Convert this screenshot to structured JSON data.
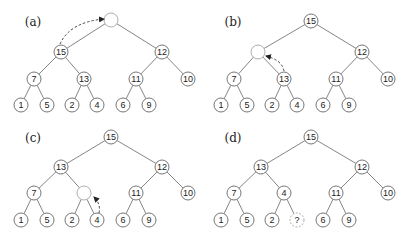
{
  "figure": {
    "panels": [
      {
        "id": "a",
        "label": "(a)",
        "offset": [
          0,
          0
        ],
        "nodes": [
          {
            "key": "root",
            "value": "",
            "style": "empty",
            "x": 111,
            "y": 20
          },
          {
            "key": "L",
            "value": "15",
            "style": "normal",
            "x": 61,
            "y": 52
          },
          {
            "key": "R",
            "value": "12",
            "style": "normal",
            "x": 162,
            "y": 52
          },
          {
            "key": "LL",
            "value": "7",
            "style": "normal",
            "x": 34,
            "y": 79
          },
          {
            "key": "LR",
            "value": "13",
            "style": "normal",
            "x": 84,
            "y": 79
          },
          {
            "key": "RL",
            "value": "11",
            "style": "normal",
            "x": 136,
            "y": 79
          },
          {
            "key": "RR",
            "value": "10",
            "style": "normal",
            "x": 188,
            "y": 79
          },
          {
            "key": "LLL",
            "value": "1",
            "style": "normal",
            "x": 21,
            "y": 105
          },
          {
            "key": "LLR",
            "value": "5",
            "style": "normal",
            "x": 47,
            "y": 105
          },
          {
            "key": "LRL",
            "value": "2",
            "style": "normal",
            "x": 72,
            "y": 105
          },
          {
            "key": "LRR",
            "value": "4",
            "style": "normal",
            "x": 97,
            "y": 105
          },
          {
            "key": "RLL",
            "value": "6",
            "style": "normal",
            "x": 123,
            "y": 105
          },
          {
            "key": "RLR",
            "value": "9",
            "style": "normal",
            "x": 149,
            "y": 105
          }
        ],
        "arrow": {
          "from": "L",
          "to": "root",
          "path": "M 60 44 Q 70 22 104 19"
        }
      },
      {
        "id": "b",
        "label": "(b)",
        "offset": [
          200,
          0
        ],
        "nodes": [
          {
            "key": "root",
            "value": "15",
            "style": "normal",
            "x": 111,
            "y": 21
          },
          {
            "key": "L",
            "value": "",
            "style": "empty",
            "x": 58,
            "y": 52
          },
          {
            "key": "R",
            "value": "12",
            "style": "normal",
            "x": 162,
            "y": 52
          },
          {
            "key": "LL",
            "value": "7",
            "style": "normal",
            "x": 34,
            "y": 79
          },
          {
            "key": "LR",
            "value": "13",
            "style": "normal",
            "x": 84,
            "y": 79
          },
          {
            "key": "RL",
            "value": "11",
            "style": "normal",
            "x": 136,
            "y": 79
          },
          {
            "key": "RR",
            "value": "10",
            "style": "normal",
            "x": 188,
            "y": 79
          },
          {
            "key": "LLL",
            "value": "1",
            "style": "normal",
            "x": 21,
            "y": 105
          },
          {
            "key": "LLR",
            "value": "5",
            "style": "normal",
            "x": 47,
            "y": 105
          },
          {
            "key": "LRL",
            "value": "2",
            "style": "normal",
            "x": 72,
            "y": 105
          },
          {
            "key": "LRR",
            "value": "4",
            "style": "normal",
            "x": 97,
            "y": 105
          },
          {
            "key": "RLL",
            "value": "6",
            "style": "normal",
            "x": 123,
            "y": 105
          },
          {
            "key": "RLR",
            "value": "9",
            "style": "normal",
            "x": 149,
            "y": 105
          }
        ],
        "arrow": {
          "from": "LR",
          "to": "L",
          "path": "M 84 71 Q 82 60 66 56"
        }
      },
      {
        "id": "c",
        "label": "(c)",
        "offset": [
          0,
          116
        ],
        "nodes": [
          {
            "key": "root",
            "value": "15",
            "style": "normal",
            "x": 111,
            "y": 21
          },
          {
            "key": "L",
            "value": "13",
            "style": "normal",
            "x": 61,
            "y": 51
          },
          {
            "key": "R",
            "value": "12",
            "style": "normal",
            "x": 162,
            "y": 51
          },
          {
            "key": "LL",
            "value": "7",
            "style": "normal",
            "x": 34,
            "y": 77
          },
          {
            "key": "LR",
            "value": "",
            "style": "empty",
            "x": 84,
            "y": 77
          },
          {
            "key": "RL",
            "value": "11",
            "style": "normal",
            "x": 136,
            "y": 77
          },
          {
            "key": "RR",
            "value": "10",
            "style": "normal",
            "x": 188,
            "y": 77
          },
          {
            "key": "LLL",
            "value": "1",
            "style": "normal",
            "x": 21,
            "y": 104
          },
          {
            "key": "LLR",
            "value": "5",
            "style": "normal",
            "x": 47,
            "y": 104
          },
          {
            "key": "LRL",
            "value": "2",
            "style": "normal",
            "x": 72,
            "y": 104
          },
          {
            "key": "LRR",
            "value": "4",
            "style": "normal",
            "x": 97,
            "y": 104
          },
          {
            "key": "RLL",
            "value": "6",
            "style": "normal",
            "x": 123,
            "y": 104
          },
          {
            "key": "RLR",
            "value": "9",
            "style": "normal",
            "x": 149,
            "y": 104
          }
        ],
        "arrow": {
          "from": "LRR",
          "to": "LR",
          "path": "M 99 97 Q 101 88 94 81"
        }
      },
      {
        "id": "d",
        "label": "(d)",
        "offset": [
          200,
          116
        ],
        "nodes": [
          {
            "key": "root",
            "value": "15",
            "style": "normal",
            "x": 111,
            "y": 21
          },
          {
            "key": "L",
            "value": "13",
            "style": "normal",
            "x": 61,
            "y": 51
          },
          {
            "key": "R",
            "value": "12",
            "style": "normal",
            "x": 162,
            "y": 51
          },
          {
            "key": "LL",
            "value": "7",
            "style": "normal",
            "x": 34,
            "y": 77
          },
          {
            "key": "LR",
            "value": "4",
            "style": "normal",
            "x": 84,
            "y": 77
          },
          {
            "key": "RL",
            "value": "11",
            "style": "normal",
            "x": 136,
            "y": 77
          },
          {
            "key": "RR",
            "value": "10",
            "style": "normal",
            "x": 188,
            "y": 77
          },
          {
            "key": "LLL",
            "value": "1",
            "style": "normal",
            "x": 21,
            "y": 104
          },
          {
            "key": "LLR",
            "value": "5",
            "style": "normal",
            "x": 47,
            "y": 104
          },
          {
            "key": "LRL",
            "value": "2",
            "style": "normal",
            "x": 72,
            "y": 104
          },
          {
            "key": "LRR",
            "value": "?",
            "style": "dashed",
            "x": 97,
            "y": 104
          },
          {
            "key": "RLL",
            "value": "6",
            "style": "normal",
            "x": 123,
            "y": 104
          },
          {
            "key": "RLR",
            "value": "9",
            "style": "normal",
            "x": 149,
            "y": 104
          }
        ],
        "arrow": null
      }
    ],
    "edges": [
      [
        "root",
        "L"
      ],
      [
        "root",
        "R"
      ],
      [
        "L",
        "LL"
      ],
      [
        "L",
        "LR"
      ],
      [
        "R",
        "RL"
      ],
      [
        "R",
        "RR"
      ],
      [
        "LL",
        "LLL"
      ],
      [
        "LL",
        "LLR"
      ],
      [
        "LR",
        "LRL"
      ],
      [
        "LR",
        "LRR"
      ],
      [
        "RL",
        "RLL"
      ],
      [
        "RL",
        "RLR"
      ]
    ],
    "label_position": [
      33,
      22
    ],
    "node_radius": 7
  }
}
